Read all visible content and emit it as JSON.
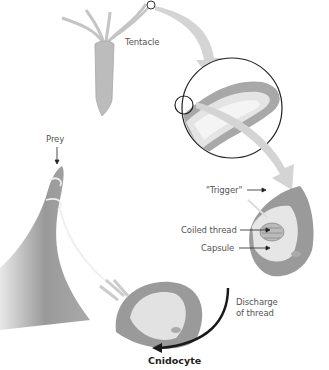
{
  "diagram": {
    "title": "Cnidocyte",
    "labels": {
      "tentacle": "Tentacle",
      "prey": "Prey",
      "trigger": "\"Trigger\"",
      "coiled_thread": "Coiled thread",
      "capsule": "Capsule",
      "discharge_line1": "Discharge",
      "discharge_line2": "of thread"
    },
    "colors": {
      "organism": "#b8b8b8",
      "arrow_light": "#d4d4d4",
      "arrow_dark": "#1a1a1a",
      "cell": "#9a9a9a",
      "text": "#555555"
    }
  }
}
